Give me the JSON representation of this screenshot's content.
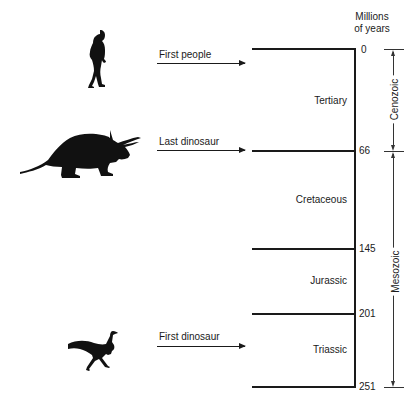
{
  "axis": {
    "title_line1": "Millions",
    "title_line2": "of years",
    "ticks": [
      {
        "label": "0",
        "value": 0
      },
      {
        "label": "66",
        "value": 66
      },
      {
        "label": "145",
        "value": 145
      },
      {
        "label": "201",
        "value": 201
      },
      {
        "label": "251",
        "value": 251
      }
    ]
  },
  "periods": [
    {
      "name": "Tertiary",
      "start": 0,
      "end": 66
    },
    {
      "name": "Cretaceous",
      "start": 66,
      "end": 145
    },
    {
      "name": "Jurassic",
      "start": 145,
      "end": 201
    },
    {
      "name": "Triassic",
      "start": 201,
      "end": 251
    }
  ],
  "eras": [
    {
      "name": "Cenozoic",
      "start": 0,
      "end": 66
    },
    {
      "name": "Mesozoic",
      "start": 66,
      "end": 251
    }
  ],
  "events": [
    {
      "label": "First people",
      "at": 0,
      "icon": "human-silhouette-icon"
    },
    {
      "label": "Last dinosaur",
      "at": 66,
      "icon": "triceratops-silhouette-icon"
    },
    {
      "label": "First dinosaur",
      "at": 201,
      "icon": "theropod-silhouette-icon"
    }
  ]
}
